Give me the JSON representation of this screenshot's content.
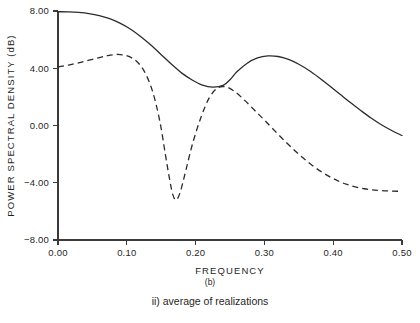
{
  "chart_data": {
    "type": "line",
    "title": "",
    "xlabel": "FREQUENCY",
    "ylabel": "POWER SPECTRAL DENSITY (dB)",
    "xlim": [
      0.0,
      0.5
    ],
    "ylim": [
      -8.0,
      8.0
    ],
    "grid": false,
    "legend": "none",
    "xticks": [
      0.0,
      0.1,
      0.2,
      0.3,
      0.4,
      0.5
    ],
    "xtick_labels": [
      "0.00",
      "0.10",
      "0.20",
      "0.30",
      "0.40",
      "0.50"
    ],
    "yticks": [
      -8.0,
      -4.0,
      0.0,
      4.0,
      8.0
    ],
    "ytick_labels": [
      "-8.00",
      "-4.00",
      "0.00",
      "4.00",
      "8.00"
    ],
    "series": [
      {
        "name": "true spectrum",
        "style": "solid",
        "x": [
          0.0,
          0.015,
          0.03,
          0.045,
          0.06,
          0.075,
          0.09,
          0.105,
          0.12,
          0.135,
          0.15,
          0.165,
          0.18,
          0.195,
          0.21,
          0.225,
          0.24,
          0.25,
          0.26,
          0.275,
          0.29,
          0.305,
          0.32,
          0.335,
          0.35,
          0.365,
          0.38,
          0.395,
          0.41,
          0.425,
          0.44,
          0.455,
          0.47,
          0.485,
          0.5
        ],
        "values": [
          7.95,
          7.94,
          7.9,
          7.82,
          7.68,
          7.46,
          7.15,
          6.74,
          6.22,
          5.62,
          4.95,
          4.28,
          3.66,
          3.18,
          2.82,
          2.68,
          2.8,
          3.2,
          3.75,
          4.35,
          4.72,
          4.86,
          4.82,
          4.62,
          4.28,
          3.84,
          3.32,
          2.76,
          2.18,
          1.6,
          1.05,
          0.52,
          0.05,
          -0.35,
          -0.7
        ]
      },
      {
        "name": "average of realizations",
        "style": "dashed",
        "x": [
          0.0,
          0.015,
          0.03,
          0.045,
          0.06,
          0.072,
          0.084,
          0.096,
          0.108,
          0.118,
          0.128,
          0.138,
          0.148,
          0.156,
          0.162,
          0.167,
          0.172,
          0.178,
          0.186,
          0.196,
          0.208,
          0.22,
          0.232,
          0.244,
          0.256,
          0.27,
          0.285,
          0.3,
          0.318,
          0.336,
          0.355,
          0.375,
          0.398,
          0.42,
          0.445,
          0.47,
          0.5
        ],
        "values": [
          4.1,
          4.22,
          4.38,
          4.56,
          4.74,
          4.88,
          4.96,
          4.92,
          4.7,
          4.3,
          3.55,
          2.3,
          0.3,
          -2.0,
          -3.7,
          -4.85,
          -5.2,
          -4.6,
          -3.1,
          -1.2,
          0.6,
          1.95,
          2.62,
          2.7,
          2.4,
          1.82,
          1.1,
          0.38,
          -0.52,
          -1.38,
          -2.22,
          -2.98,
          -3.66,
          -4.12,
          -4.42,
          -4.55,
          -4.6
        ]
      }
    ]
  },
  "caption": {
    "panel_label": "(b)",
    "description": "ii) average of realizations"
  },
  "axis_geometry": {
    "plot_left": 58,
    "plot_right": 402,
    "plot_top": 11,
    "plot_bottom": 240
  }
}
